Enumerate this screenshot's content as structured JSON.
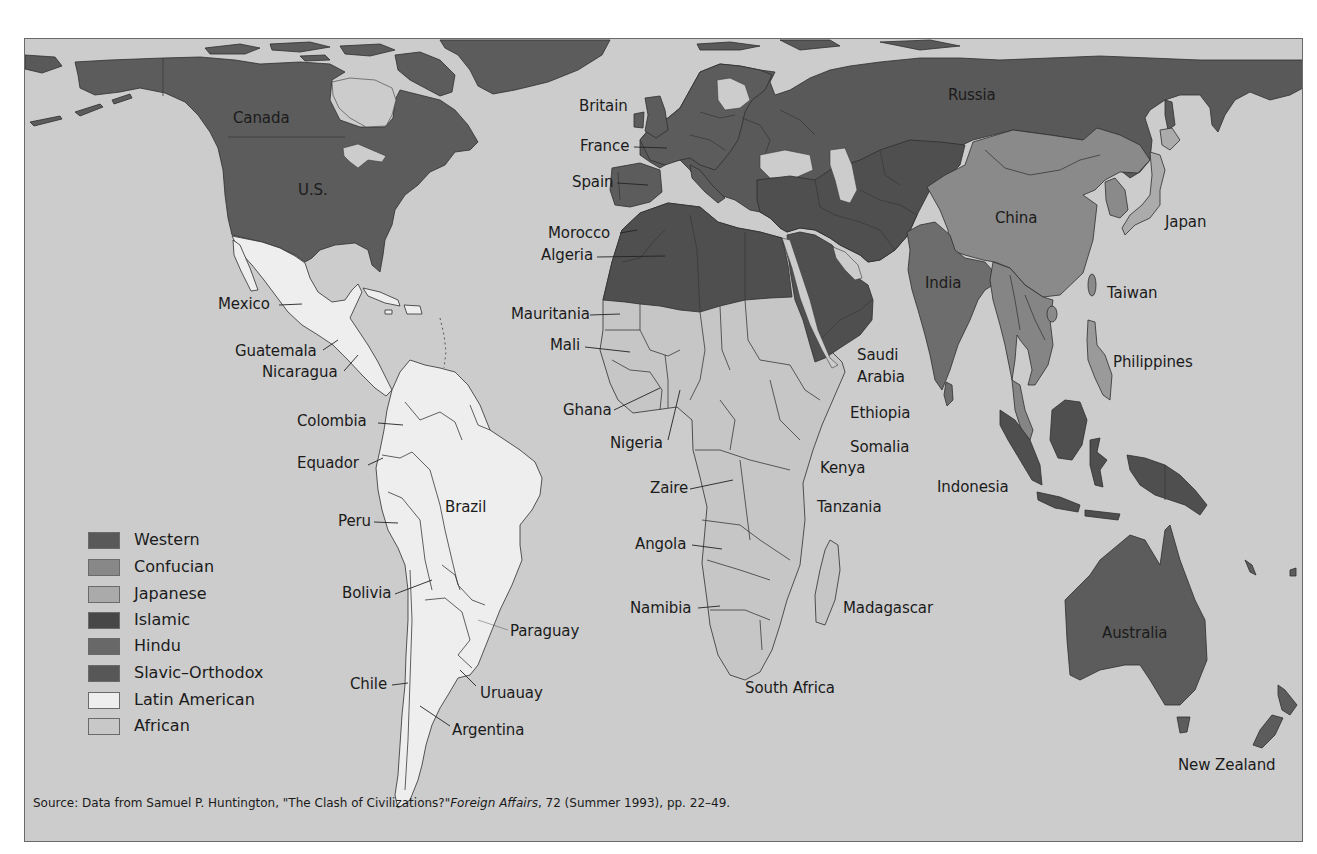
{
  "colors": {
    "ocean": "#cccccc",
    "western": "#5c5c5c",
    "confucian": "#8a8a8a",
    "japanese": "#ababab",
    "islamic": "#4f4f4f",
    "hindu": "#6d6d6d",
    "slavic": "#595959",
    "latin": "#eeeeee",
    "african": "#c6c6c6",
    "seasia": "#858585",
    "philippines": "#9a9a9a"
  },
  "map": {
    "labels": [
      {
        "text": "Canada"
      },
      {
        "text": "U.S."
      },
      {
        "text": "Britain"
      },
      {
        "text": "France"
      },
      {
        "text": "Spain"
      },
      {
        "text": "Morocco"
      },
      {
        "text": "Algeria"
      },
      {
        "text": "Mauritania"
      },
      {
        "text": "Mali"
      },
      {
        "text": "Ghana"
      },
      {
        "text": "Nigeria"
      },
      {
        "text": "Zaire"
      },
      {
        "text": "Angola"
      },
      {
        "text": "Namibia"
      },
      {
        "text": "South Africa"
      },
      {
        "text": "Mexico"
      },
      {
        "text": "Guatemala"
      },
      {
        "text": "Nicaragua"
      },
      {
        "text": "Colombia"
      },
      {
        "text": "Equador"
      },
      {
        "text": "Peru"
      },
      {
        "text": "Brazil"
      },
      {
        "text": "Bolivia"
      },
      {
        "text": "Paraguay"
      },
      {
        "text": "Chile"
      },
      {
        "text": "Uruauay"
      },
      {
        "text": "Argentina"
      },
      {
        "text": "Saudi\nArabia"
      },
      {
        "text": "Ethiopia"
      },
      {
        "text": "Somalia"
      },
      {
        "text": "Kenya"
      },
      {
        "text": "Tanzania"
      },
      {
        "text": "Madagascar"
      },
      {
        "text": "Indonesia"
      },
      {
        "text": "Russia"
      },
      {
        "text": "China"
      },
      {
        "text": "Japan"
      },
      {
        "text": "India"
      },
      {
        "text": "Taiwan"
      },
      {
        "text": "Philippines"
      },
      {
        "text": "Australia"
      },
      {
        "text": "New Zealand"
      }
    ]
  },
  "legend": {
    "items": [
      {
        "label": "Western",
        "color": "#595959"
      },
      {
        "label": "Confucian",
        "color": "#888888"
      },
      {
        "label": "Japanese",
        "color": "#aaaaaa"
      },
      {
        "label": "Islamic",
        "color": "#474747"
      },
      {
        "label": "Hindu",
        "color": "#686868"
      },
      {
        "label": "Slavic–Orthodox",
        "color": "#575757"
      },
      {
        "label": "Latin American",
        "color": "#eeeeee"
      },
      {
        "label": "African",
        "color": "#c8c8c8"
      }
    ]
  },
  "source": {
    "prefix": "Source: Data from Samuel P. Huntington, \"The Clash of Civilizations?\"",
    "journal": "Foreign Affairs",
    "suffix": ", 72 (Summer 1993), pp. 22–49."
  }
}
